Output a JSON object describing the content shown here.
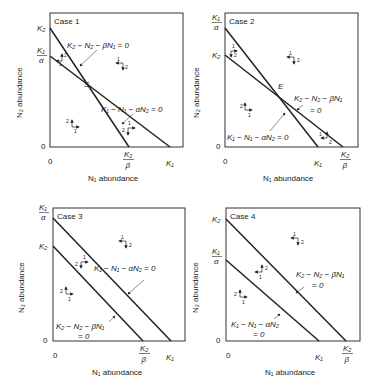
{
  "panels": [
    {
      "case_label": "Case 1",
      "box": {
        "x1": 50,
        "y1": 13,
        "x2": 183,
        "y2": 147
      },
      "y_ticks": [
        {
          "label_top": "K2",
          "y": 28
        },
        {
          "label_frac": [
            "K1",
            "α"
          ],
          "y": 56
        }
      ],
      "x_ticks": [
        {
          "label_frac": [
            "K2",
            "β"
          ],
          "x": 129
        },
        {
          "label": "K1",
          "x": 170
        }
      ],
      "line_a": {
        "from": [
          50,
          28
        ],
        "to": [
          129,
          147
        ],
        "label": "K₂ − N₂ − βN₁ = 0"
      },
      "line_b": {
        "from": [
          50,
          56
        ],
        "to": [
          170,
          147
        ],
        "label": "K₁ − N₁ − αN₂ = 0"
      },
      "intersection_label": "S",
      "origin_x": "0",
      "origin_y": "0",
      "xlabel": "N₁ abundance",
      "ylabel": "N₂ abundance"
    },
    {
      "case_label": "Case 2",
      "box": {
        "x1": 225,
        "y1": 13,
        "x2": 358,
        "y2": 147
      },
      "line_a": {
        "label_1": "K₂ − N₂ − βN₁",
        "label_2": "= 0"
      },
      "line_b": {
        "label": "K₁ − N₁ − αN₂ = 0"
      },
      "intersection_label": "E",
      "origin_x": "0",
      "origin_y": "0",
      "xlabel": "N₁ abundance",
      "ylabel": "N₂ abundance"
    },
    {
      "case_label": "Case 3",
      "box": {
        "x1": 53,
        "y1": 208,
        "x2": 185,
        "y2": 341
      },
      "line_a": {
        "label_1": "K₂ − N₂ − βN₁",
        "label_2": "= 0"
      },
      "line_b": {
        "label": "K₁ − N₁ − αN₂ = 0"
      },
      "origin_x": "0",
      "origin_y": "0",
      "xlabel": "N₁ abundance",
      "ylabel": "N₂ abundance"
    },
    {
      "case_label": "Case 4",
      "box": {
        "x1": 226,
        "y1": 208,
        "x2": 360,
        "y2": 341
      },
      "line_a": {
        "label_1": "K₂ − N₂ − βN₁",
        "label_2": "= 0"
      },
      "line_b": {
        "label_1": "K₁ − N₁ − αN₂",
        "label_2": "= 0"
      },
      "origin_x": "0",
      "origin_y": "0",
      "xlabel": "N₁ abundance",
      "ylabel": "N₂ abundance"
    }
  ],
  "symbols": {
    "K1": "K₁",
    "K2": "K₂",
    "alpha": "α",
    "beta": "β",
    "arrow_species_1": "1",
    "arrow_species_2": "2"
  }
}
